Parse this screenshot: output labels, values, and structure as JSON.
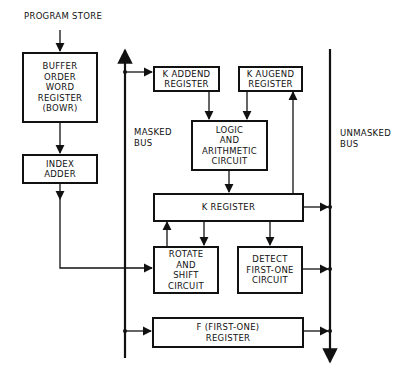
{
  "title_label": "PROGRAM STORE",
  "boxes": {
    "bowr": [
      "BUFFER",
      "ORDER",
      "WORD",
      "REGISTER",
      "(BOWR)"
    ],
    "index_adder": [
      "INDEX",
      "ADDER"
    ],
    "k_addend": [
      "K ADDEND",
      "REGISTER"
    ],
    "k_augend": [
      "K AUGEND",
      "REGISTER"
    ],
    "logic": [
      "LOGIC",
      "AND",
      "ARITHMETIC",
      "CIRCUIT"
    ],
    "k_register": [
      "K REGISTER"
    ],
    "rotate": [
      "ROTATE",
      "AND",
      "SHIFT",
      "CIRCUIT"
    ],
    "detect": [
      "DETECT",
      "FIRST-ONE",
      "CIRCUIT"
    ],
    "f_register": [
      "F (FIRST-ONE)",
      "REGISTER"
    ]
  },
  "buses": {
    "masked": [
      "MASKED",
      "BUS"
    ],
    "unmasked": [
      "UNMASKED",
      "BUS"
    ]
  },
  "colors": {
    "line": "#111111",
    "background": "#ffffff"
  }
}
